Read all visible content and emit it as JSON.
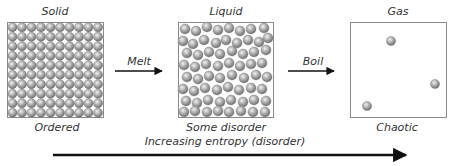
{
  "diagram": {
    "states": [
      {
        "title": "Solid",
        "caption": "Ordered"
      },
      {
        "title": "Liquid",
        "caption": "Some disorder"
      },
      {
        "title": "Gas",
        "caption": "Chaotic"
      }
    ],
    "transitions": [
      {
        "label": "Melt"
      },
      {
        "label": "Boil"
      }
    ],
    "axis": {
      "label": "Increasing entropy (disorder)"
    },
    "colors": {
      "particle": "#9a9a9a",
      "particle_highlight": "#e8e8e8",
      "box_border": "#8a8a8a",
      "arrow": "#111111",
      "text": "#333333"
    },
    "solid_grid": {
      "rows": 10,
      "cols": 10
    },
    "liquid_particles": [
      [
        185,
        29
      ],
      [
        196,
        31
      ],
      [
        207,
        27
      ],
      [
        218,
        30
      ],
      [
        229,
        28
      ],
      [
        240,
        31
      ],
      [
        251,
        29
      ],
      [
        264,
        28
      ],
      [
        183,
        41
      ],
      [
        193,
        44
      ],
      [
        204,
        40
      ],
      [
        216,
        43
      ],
      [
        226,
        40
      ],
      [
        237,
        43
      ],
      [
        248,
        40
      ],
      [
        259,
        42
      ],
      [
        268,
        38
      ],
      [
        187,
        53
      ],
      [
        198,
        55
      ],
      [
        209,
        52
      ],
      [
        220,
        54
      ],
      [
        232,
        51
      ],
      [
        243,
        54
      ],
      [
        254,
        52
      ],
      [
        266,
        50
      ],
      [
        184,
        65
      ],
      [
        195,
        67
      ],
      [
        206,
        64
      ],
      [
        218,
        66
      ],
      [
        229,
        63
      ],
      [
        240,
        66
      ],
      [
        251,
        64
      ],
      [
        262,
        63
      ],
      [
        187,
        77
      ],
      [
        198,
        79
      ],
      [
        209,
        76
      ],
      [
        220,
        78
      ],
      [
        232,
        75
      ],
      [
        244,
        78
      ],
      [
        256,
        75
      ],
      [
        267,
        77
      ],
      [
        183,
        89
      ],
      [
        194,
        91
      ],
      [
        205,
        88
      ],
      [
        217,
        90
      ],
      [
        228,
        87
      ],
      [
        239,
        90
      ],
      [
        251,
        88
      ],
      [
        262,
        89
      ],
      [
        186,
        101
      ],
      [
        197,
        103
      ],
      [
        208,
        100
      ],
      [
        220,
        102
      ],
      [
        231,
        100
      ],
      [
        243,
        102
      ],
      [
        254,
        100
      ],
      [
        266,
        101
      ],
      [
        184,
        112
      ],
      [
        195,
        111
      ],
      [
        207,
        112
      ],
      [
        218,
        111
      ],
      [
        229,
        112
      ],
      [
        241,
        111
      ],
      [
        253,
        112
      ],
      [
        265,
        112
      ]
    ],
    "gas_particles": [
      [
        391,
        41
      ],
      [
        435,
        84
      ],
      [
        367,
        106
      ]
    ]
  }
}
